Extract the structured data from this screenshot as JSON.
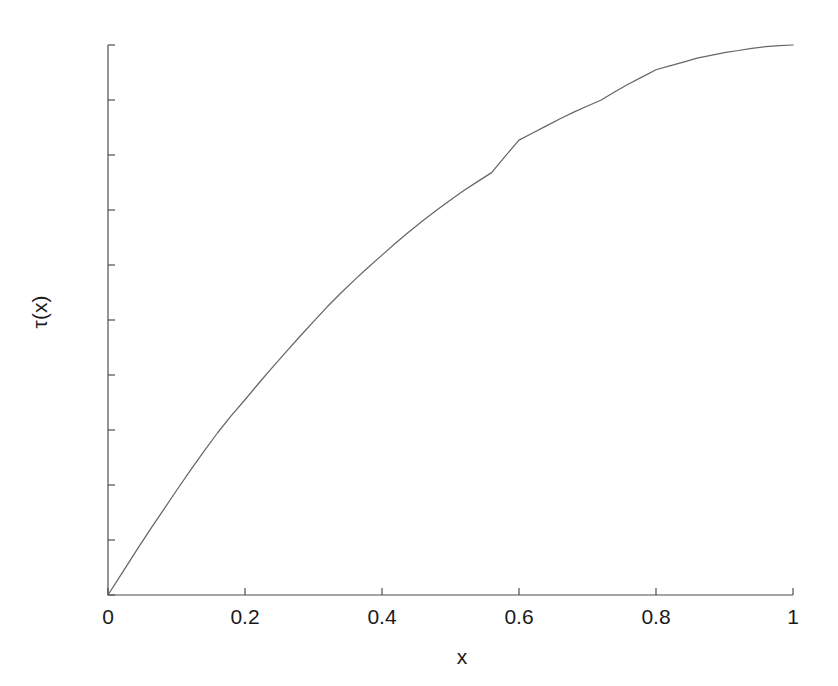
{
  "figure": {
    "background_color": "#ffffff",
    "axis_color": "#4d4d4d",
    "line_color": "#666666",
    "text_color": "#1a1a1a"
  },
  "chart_data": {
    "type": "line",
    "title": "",
    "subtitle": "",
    "xlabel": "x",
    "ylabel": "τ(x)",
    "xlim": [
      0,
      1
    ],
    "ylim": [
      0,
      1
    ],
    "grid": false,
    "legend": null,
    "xticks": [
      0,
      0.2,
      0.4,
      0.6,
      0.8,
      1
    ],
    "xticklabels": [
      "0",
      "0.2",
      "0.4",
      "0.6",
      "0.8",
      "1"
    ],
    "yticks": [
      0,
      0.1,
      0.2,
      0.3,
      0.4,
      0.5,
      0.6,
      0.7,
      0.8,
      0.9,
      1
    ],
    "yticklabels": [
      "0",
      "0.1",
      "0.2",
      "0.3",
      "0.4",
      "0.5",
      "0.6",
      "0.7",
      "0.8",
      "0.9",
      "1"
    ],
    "series": [
      {
        "name": "τ(x)",
        "x": [
          0,
          0.02,
          0.04,
          0.06,
          0.08,
          0.1,
          0.12,
          0.14,
          0.16,
          0.18,
          0.2,
          0.22,
          0.24,
          0.26,
          0.28,
          0.3,
          0.32,
          0.34,
          0.36,
          0.38,
          0.4,
          0.42,
          0.44,
          0.46,
          0.48,
          0.5,
          0.52,
          0.54,
          0.56,
          0.58,
          0.6,
          0.62,
          0.64,
          0.66,
          0.68,
          0.7,
          0.72,
          0.74,
          0.76,
          0.78,
          0.8,
          0.82,
          0.84,
          0.86,
          0.88,
          0.9,
          0.92,
          0.94,
          0.96,
          0.98,
          1
        ],
        "y": [
          0.0,
          0.039,
          0.078,
          0.116,
          0.153,
          0.19,
          0.226,
          0.261,
          0.295,
          0.326,
          0.355,
          0.385,
          0.414,
          0.442,
          0.47,
          0.497,
          0.524,
          0.549,
          0.573,
          0.596,
          0.618,
          0.64,
          0.661,
          0.681,
          0.7,
          0.718,
          0.736,
          0.752,
          0.768,
          0.798,
          0.827,
          0.84,
          0.853,
          0.866,
          0.878,
          0.889,
          0.9,
          0.915,
          0.929,
          0.942,
          0.955,
          0.962,
          0.969,
          0.976,
          0.981,
          0.986,
          0.99,
          0.994,
          0.997,
          0.999,
          1.0
        ]
      }
    ]
  },
  "axes_geometry": {
    "left_px": 108,
    "top_px": 45,
    "right_px": 793,
    "bottom_px": 595
  }
}
